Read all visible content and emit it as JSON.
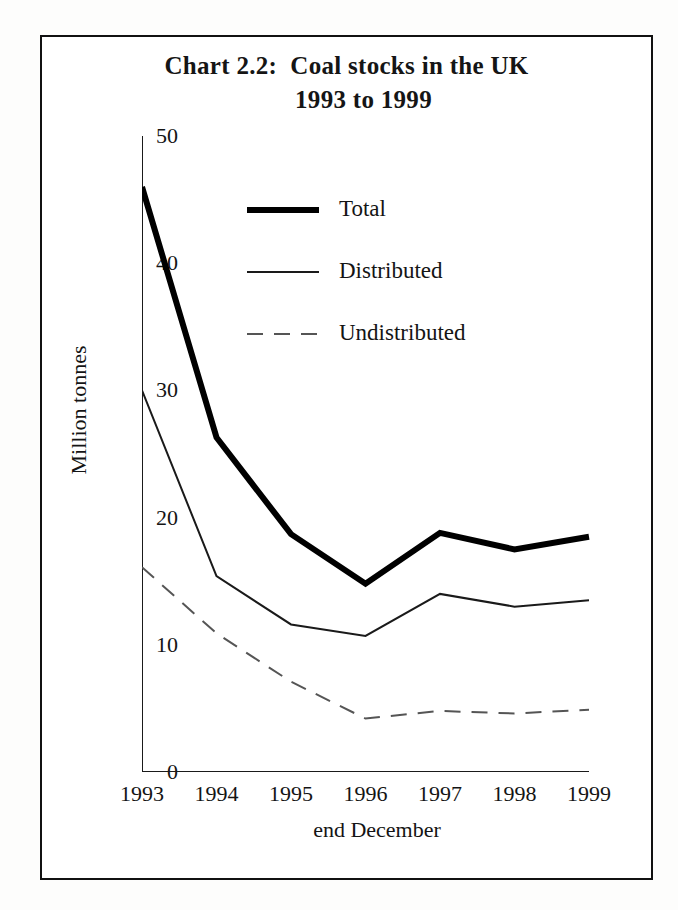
{
  "chart_data": {
    "type": "line",
    "title": "Chart 2.2:  Coal stocks in the UK",
    "subtitle": "1993 to 1999",
    "title_lines": [
      "Chart 2.2:  Coal stocks in the UK",
      "1993 to 1999"
    ],
    "xlabel": "end December",
    "ylabel": "Million tonnes",
    "categories": [
      "1993",
      "1994",
      "1995",
      "1996",
      "1997",
      "1998",
      "1999"
    ],
    "x": [
      1993,
      1994,
      1995,
      1996,
      1997,
      1998,
      1999
    ],
    "ylim": [
      0,
      50
    ],
    "yticks": [
      0,
      10,
      20,
      30,
      40,
      50
    ],
    "ytick_labels": [
      "0",
      "10",
      "20",
      "30",
      "40",
      "50"
    ],
    "grid": false,
    "legend_position": "upper center inside",
    "series": [
      {
        "name": "Total",
        "style": "solid",
        "line_width": 6,
        "color": "#000000",
        "values": [
          46.0,
          26.3,
          18.7,
          14.8,
          18.8,
          17.5,
          18.5
        ]
      },
      {
        "name": "Distributed",
        "style": "solid",
        "line_width": 2,
        "color": "#1a1a1a",
        "values": [
          30.0,
          15.4,
          11.6,
          10.7,
          14.0,
          13.0,
          13.5
        ]
      },
      {
        "name": "Undistributed",
        "style": "dashed",
        "line_width": 2,
        "color": "#555555",
        "values": [
          16.1,
          10.9,
          7.1,
          4.2,
          4.8,
          4.6,
          4.9
        ]
      }
    ]
  },
  "legend": {
    "items": [
      {
        "label": "Total",
        "swatch": "thick-solid-line-swatch"
      },
      {
        "label": "Distributed",
        "swatch": "thin-solid-line-swatch"
      },
      {
        "label": "Undistributed",
        "swatch": "dashed-line-swatch"
      }
    ]
  },
  "colors": {
    "frame": "#111111",
    "axis": "#1a1a1a",
    "total": "#000000",
    "distributed": "#1a1a1a",
    "undistributed": "#555555",
    "background": "#ffffff"
  }
}
